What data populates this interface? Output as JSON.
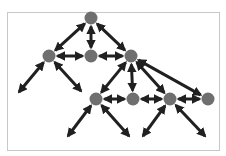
{
  "diagram": {
    "type": "hierarchical-network",
    "colors": {
      "background": "#ffffff",
      "frame": "#c8c8c8",
      "node_fill": "#6f6f6f",
      "edge": "#202020"
    },
    "frame": {
      "x": 7,
      "y": 12,
      "width": 212,
      "height": 138
    },
    "node_radius": 6.5,
    "nodes": [
      {
        "id": "root",
        "x": 91,
        "y": 18
      },
      {
        "id": "l2a",
        "x": 49,
        "y": 56
      },
      {
        "id": "l2b",
        "x": 91,
        "y": 56
      },
      {
        "id": "l2c",
        "x": 131,
        "y": 56
      },
      {
        "id": "l3a",
        "x": 96,
        "y": 99
      },
      {
        "id": "l3b",
        "x": 133,
        "y": 99
      },
      {
        "id": "l3c",
        "x": 170,
        "y": 99
      },
      {
        "id": "l3d",
        "x": 208,
        "y": 99
      }
    ],
    "endpoints": [
      {
        "id": "e1",
        "x": 19,
        "y": 92
      },
      {
        "id": "e2",
        "x": 81,
        "y": 91
      },
      {
        "id": "e3",
        "x": 68,
        "y": 136
      },
      {
        "id": "e4",
        "x": 129,
        "y": 136
      },
      {
        "id": "e5",
        "x": 143,
        "y": 136
      },
      {
        "id": "e6",
        "x": 205,
        "y": 136
      }
    ],
    "edges": [
      {
        "from": "root",
        "to": "l2a"
      },
      {
        "from": "root",
        "to": "l2b"
      },
      {
        "from": "root",
        "to": "l2c"
      },
      {
        "from": "l2a",
        "to": "l2b"
      },
      {
        "from": "l2b",
        "to": "l2c"
      },
      {
        "from": "l2a",
        "to": "e1"
      },
      {
        "from": "l2a",
        "to": "e2"
      },
      {
        "from": "l2c",
        "to": "l3a"
      },
      {
        "from": "l2c",
        "to": "l3b"
      },
      {
        "from": "l2c",
        "to": "l3c"
      },
      {
        "from": "l2c",
        "to": "l3d"
      },
      {
        "from": "l3a",
        "to": "l3b"
      },
      {
        "from": "l3b",
        "to": "l3c"
      },
      {
        "from": "l3c",
        "to": "l3d"
      },
      {
        "from": "l3a",
        "to": "e3"
      },
      {
        "from": "l3a",
        "to": "e4"
      },
      {
        "from": "l3c",
        "to": "e5"
      },
      {
        "from": "l3c",
        "to": "e6"
      }
    ]
  }
}
